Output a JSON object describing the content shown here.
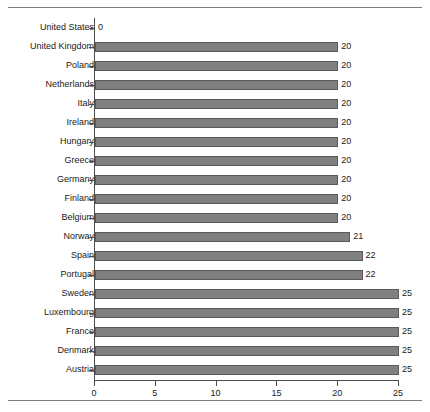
{
  "chart_data": {
    "type": "bar",
    "orientation": "horizontal",
    "title": "",
    "xlabel": "",
    "ylabel": "",
    "xlim": [
      0,
      25
    ],
    "xticks": [
      0,
      5,
      10,
      15,
      20,
      25
    ],
    "grid": false,
    "legend": false,
    "bar_color": "#808080",
    "bar_border_color": "#5a5a5a",
    "categories": [
      "United States",
      "United Kingdom",
      "Poland",
      "Netherlands",
      "Italy",
      "Ireland",
      "Hungary",
      "Greece",
      "Germany",
      "Finland",
      "Belgium",
      "Norway",
      "Spain",
      "Portugal",
      "Sweden",
      "Luxembourg",
      "France",
      "Denmark",
      "Austria"
    ],
    "values": [
      0,
      20,
      20,
      20,
      20,
      20,
      20,
      20,
      20,
      20,
      20,
      21,
      22,
      22,
      25,
      25,
      25,
      25,
      25
    ],
    "data_labels": [
      "0",
      "20",
      "20",
      "20",
      "20",
      "20",
      "20",
      "20",
      "20",
      "20",
      "20",
      "21",
      "22",
      "22",
      "25",
      "25",
      "25",
      "25",
      "25"
    ]
  }
}
